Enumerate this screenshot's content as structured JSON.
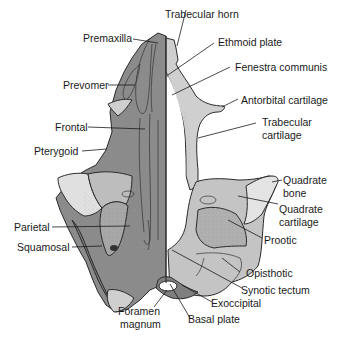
{
  "diagram": {
    "colors": {
      "dermal_bone_dark": "#8a8a8a",
      "dermal_bone_mid": "#9c9c9c",
      "cartilage_light": "#c8c8c8",
      "cartilage_pale": "#e2e2e2",
      "outline": "#2a2a2a",
      "background": "#ffffff"
    },
    "labels": {
      "left": [
        {
          "id": "premaxilla",
          "text": "Premaxilla"
        },
        {
          "id": "prevomer",
          "text": "Prevomer"
        },
        {
          "id": "frontal",
          "text": "Frontal"
        },
        {
          "id": "pterygoid",
          "text": "Pterygoid"
        },
        {
          "id": "parietal",
          "text": "Parietal"
        },
        {
          "id": "squamosal",
          "text": "Squamosal"
        }
      ],
      "right": [
        {
          "id": "trabecular_horn",
          "text": "Trabecular horn"
        },
        {
          "id": "ethmoid_plate",
          "text": "Ethmoid plate"
        },
        {
          "id": "fenestra_communis",
          "text": "Fenestra communis"
        },
        {
          "id": "antorbital_cartilage",
          "text": "Antorbital cartilage"
        },
        {
          "id": "trabecular_cartilage_1",
          "text": "Trabecular"
        },
        {
          "id": "trabecular_cartilage_2",
          "text": "cartilage"
        },
        {
          "id": "quadrate_bone_1",
          "text": "Quadrate"
        },
        {
          "id": "quadrate_bone_2",
          "text": "bone"
        },
        {
          "id": "quadrate_cartilage_1",
          "text": "Quadrate"
        },
        {
          "id": "quadrate_cartilage_2",
          "text": "cartilage"
        },
        {
          "id": "prootic",
          "text": "Prootic"
        },
        {
          "id": "opisthotic",
          "text": "Opisthotic"
        },
        {
          "id": "synotic_tectum",
          "text": "Synotic tectum"
        },
        {
          "id": "exoccipital",
          "text": "Exoccipital"
        }
      ],
      "bottom": [
        {
          "id": "foramen_magnum_1",
          "text": "Foramen"
        },
        {
          "id": "foramen_magnum_2",
          "text": "magnum"
        },
        {
          "id": "basal_plate",
          "text": "Basal plate"
        }
      ]
    }
  }
}
